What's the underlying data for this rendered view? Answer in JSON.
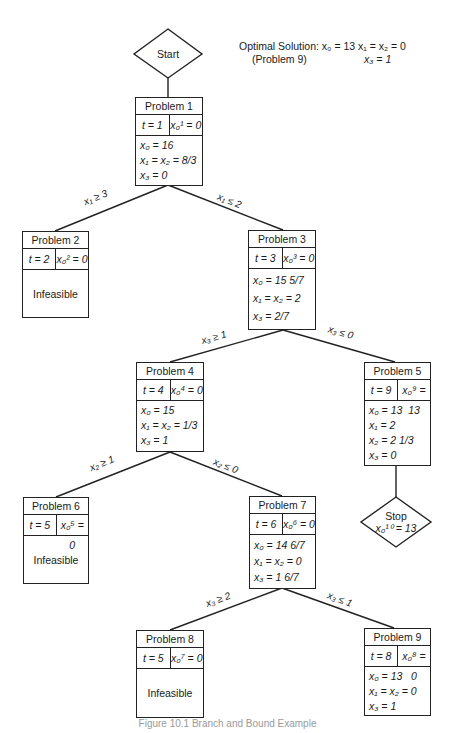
{
  "start": {
    "label": "Start"
  },
  "optimal": {
    "line1": "Optimal Solution:  x₀ = 13   x₁ = x₂ = 0",
    "line2": "(Problem 9)",
    "line2b": "x₃ = 1"
  },
  "problems": [
    {
      "id": "p1",
      "title": "Problem 1",
      "t": "t = 1",
      "x0": "x₀¹ = 0",
      "lines": [
        "x₀ = 16",
        "x₁ = x₂ = 8/3",
        "x₃ = 0"
      ]
    },
    {
      "id": "p2",
      "title": "Problem 2",
      "t": "t = 2",
      "x0": "x₀² = 0",
      "status": "Infeasible"
    },
    {
      "id": "p3",
      "title": "Problem 3",
      "t": "t = 3",
      "x0": "x₀³ = 0",
      "lines": [
        "x₀ = 15 5/7",
        "x₁ = x₂ = 2",
        "x₃ = 2/7"
      ]
    },
    {
      "id": "p4",
      "title": "Problem 4",
      "t": "t = 4",
      "x0": "x₀⁴ = 0",
      "lines": [
        "x₀ = 15",
        "x₁ = x₂ = 1/3",
        "x₃ = 1"
      ]
    },
    {
      "id": "p5",
      "title": "Problem 5",
      "t": "t = 9",
      "x0": "x₀⁹ = 13",
      "lines": [
        "x₀ = 13",
        "x₁ = 2",
        "x₂ = 2 1/3",
        "x₃ = 0"
      ]
    },
    {
      "id": "p6",
      "title": "Problem 6",
      "t": "t = 5",
      "x0": "x₀⁵ = 0",
      "status": "Infeasible"
    },
    {
      "id": "p7",
      "title": "Problem 7",
      "t": "t = 6",
      "x0": "x₀⁶ = 0",
      "lines": [
        "x₀ = 14 6/7",
        "x₁ = x₂ = 0",
        "x₃ = 1 6/7"
      ]
    },
    {
      "id": "p8",
      "title": "Problem 8",
      "t": "t = 5",
      "x0": "x₀⁷ = 0",
      "status": "Infeasible"
    },
    {
      "id": "p9",
      "title": "Problem 9",
      "t": "t = 8",
      "x0": "x₀⁸ = 0",
      "lines": [
        "x₀ = 13",
        "x₁ = x₂ = 0",
        "x₃ = 1"
      ]
    }
  ],
  "edges": {
    "e12": "x₁ ≥ 3",
    "e13": "x₁ ≤ 2",
    "e34": "x₃ ≥ 1",
    "e35": "x₃ ≤ 0",
    "e46": "x₂ ≥ 1",
    "e47": "x₂ ≤ 0",
    "e78": "x₃ ≥ 2",
    "e79": "x₃ ≤ 1"
  },
  "stop": {
    "label": "Stop",
    "value": "x₀¹⁰ = 13"
  },
  "caption": "Figure 10.1  Branch and Bound Example"
}
